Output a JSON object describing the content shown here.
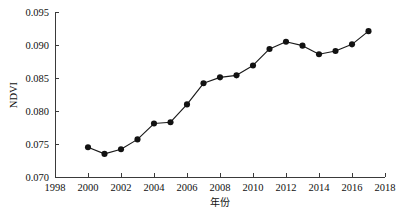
{
  "chart_data": {
    "type": "line",
    "title": "",
    "xlabel": "年份",
    "ylabel": "NDVI",
    "xlim": [
      1998,
      2018
    ],
    "ylim": [
      0.07,
      0.095
    ],
    "grid": false,
    "legend": null,
    "x_ticks": [
      1998,
      2000,
      2002,
      2004,
      2006,
      2008,
      2010,
      2012,
      2014,
      2016,
      2018
    ],
    "x_tick_labels": [
      "1998",
      "2000",
      "2002",
      "2004",
      "2006",
      "2008",
      "2010",
      "2012",
      "2014",
      "2016",
      "2018"
    ],
    "y_ticks": [
      0.07,
      0.075,
      0.08,
      0.085,
      0.09,
      0.095
    ],
    "y_tick_labels": [
      "0.070",
      "0.075",
      "0.080",
      "0.085",
      "0.090",
      "0.095"
    ],
    "marker": "filled-circle",
    "line_color": "#1a1a1a",
    "marker_color": "#121212",
    "x": [
      2000,
      2001,
      2002,
      2003,
      2004,
      2005,
      2006,
      2007,
      2008,
      2009,
      2010,
      2011,
      2012,
      2013,
      2014,
      2015,
      2016,
      2017
    ],
    "values": [
      0.0745,
      0.0735,
      0.0742,
      0.0757,
      0.0781,
      0.0783,
      0.081,
      0.0842,
      0.0851,
      0.0854,
      0.0869,
      0.0894,
      0.0905,
      0.0899,
      0.0886,
      0.0891,
      0.0901,
      0.0921
    ],
    "series": [
      {
        "name": "NDVI",
        "values": [
          0.0745,
          0.0735,
          0.0742,
          0.0757,
          0.0781,
          0.0783,
          0.081,
          0.0842,
          0.0851,
          0.0854,
          0.0869,
          0.0894,
          0.0905,
          0.0899,
          0.0886,
          0.0891,
          0.0901,
          0.0921
        ]
      }
    ]
  }
}
